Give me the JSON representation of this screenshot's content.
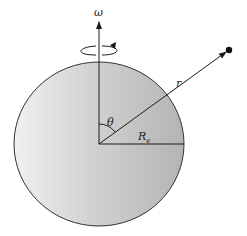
{
  "diagram": {
    "type": "physics-diagram",
    "labels": {
      "omega": "ω",
      "r": "r",
      "theta": "θ",
      "radius": "R",
      "radius_sub": "e"
    },
    "colors": {
      "sphere_light": "#f2f2f2",
      "sphere_dark": "#b8b8b8",
      "line": "#1a1a1a"
    }
  }
}
